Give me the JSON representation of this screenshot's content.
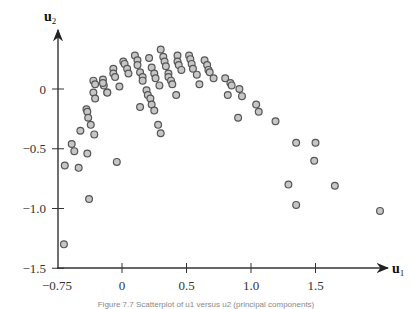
{
  "chart_data": {
    "type": "scatter",
    "title": "",
    "xlabel": "u",
    "xlabel_sub": "1",
    "ylabel": "u",
    "ylabel_sub": "2",
    "xlim": [
      -0.75,
      2.0
    ],
    "ylim": [
      -1.5,
      0.45
    ],
    "x_ticks": [
      {
        "value": -0.75,
        "label": "−0.75"
      },
      {
        "value": 0,
        "label": "0"
      },
      {
        "value": 0.5,
        "label": "0.5"
      },
      {
        "value": 1.0,
        "label": "1.0"
      },
      {
        "value": 1.5,
        "label": "1.5"
      }
    ],
    "y_ticks": [
      {
        "value": 0,
        "label": "0"
      },
      {
        "value": -0.5,
        "label": "−0.5"
      },
      {
        "value": -1.0,
        "label": "−1.0"
      },
      {
        "value": -1.5,
        "label": "−1.5"
      }
    ],
    "grid": false,
    "legend": null,
    "marker": {
      "fill": "#c6c6c6",
      "stroke": "#555555",
      "radius": 3.4
    },
    "points": [
      [
        -0.21,
        0.03
      ],
      [
        -0.17,
        -0.03
      ],
      [
        -0.33,
        -0.03
      ],
      [
        -0.31,
        -0.08
      ],
      [
        -0.41,
        -0.17
      ],
      [
        -0.4,
        -0.19
      ],
      [
        -0.39,
        -0.24
      ],
      [
        -0.36,
        -0.3
      ],
      [
        -0.48,
        -0.35
      ],
      [
        -0.32,
        -0.38
      ],
      [
        -0.58,
        -0.46
      ],
      [
        -0.55,
        -0.52
      ],
      [
        -0.4,
        -0.54
      ],
      [
        -0.66,
        -0.64
      ],
      [
        -0.5,
        -0.66
      ],
      [
        -0.06,
        -0.61
      ],
      [
        -0.38,
        -0.92
      ],
      [
        -0.67,
        -1.3
      ],
      [
        -0.33,
        0.07
      ],
      [
        -0.31,
        0.04
      ],
      [
        -0.22,
        0.08
      ],
      [
        -0.22,
        0.05
      ],
      [
        -0.17,
        -0.03
      ],
      [
        -0.1,
        0.17
      ],
      [
        -0.1,
        0.13
      ],
      [
        -0.08,
        0.1
      ],
      [
        -0.03,
        0.02
      ],
      [
        0.01,
        0.23
      ],
      [
        0.02,
        0.21
      ],
      [
        0.04,
        0.17
      ],
      [
        0.05,
        0.13
      ],
      [
        0.1,
        0.28
      ],
      [
        0.12,
        0.24
      ],
      [
        0.12,
        0.2
      ],
      [
        0.14,
        0.14
      ],
      [
        0.16,
        0.1
      ],
      [
        0.16,
        0.07
      ],
      [
        0.21,
        0.26
      ],
      [
        0.23,
        0.18
      ],
      [
        0.25,
        0.13
      ],
      [
        0.26,
        0.09
      ],
      [
        0.29,
        0.03
      ],
      [
        0.3,
        0.33
      ],
      [
        0.32,
        0.27
      ],
      [
        0.33,
        0.23
      ],
      [
        0.34,
        0.19
      ],
      [
        0.36,
        0.13
      ],
      [
        0.36,
        0.1
      ],
      [
        0.38,
        0.07
      ],
      [
        0.39,
        0.04
      ],
      [
        0.19,
        -0.01
      ],
      [
        0.2,
        -0.05
      ],
      [
        0.22,
        -0.08
      ],
      [
        0.23,
        -0.13
      ],
      [
        0.25,
        -0.18
      ],
      [
        0.28,
        -0.3
      ],
      [
        0.3,
        -0.37
      ],
      [
        0.14,
        -0.15
      ],
      [
        0.42,
        -0.05
      ],
      [
        0.43,
        0.28
      ],
      [
        0.43,
        0.23
      ],
      [
        0.44,
        0.2
      ],
      [
        0.46,
        0.16
      ],
      [
        0.52,
        0.28
      ],
      [
        0.53,
        0.25
      ],
      [
        0.54,
        0.21
      ],
      [
        0.55,
        0.17
      ],
      [
        0.58,
        0.12
      ],
      [
        0.6,
        0.04
      ],
      [
        0.64,
        0.24
      ],
      [
        0.66,
        0.2
      ],
      [
        0.67,
        0.16
      ],
      [
        0.68,
        0.14
      ],
      [
        0.71,
        0.09
      ],
      [
        0.8,
        0.09
      ],
      [
        0.84,
        0.05
      ],
      [
        0.85,
        0.03
      ],
      [
        0.82,
        -0.05
      ],
      [
        0.91,
        0.0
      ],
      [
        0.93,
        -0.06
      ],
      [
        0.9,
        -0.24
      ],
      [
        1.04,
        -0.13
      ],
      [
        1.06,
        -0.19
      ],
      [
        1.19,
        -0.27
      ],
      [
        1.35,
        -0.45
      ],
      [
        1.49,
        -0.6
      ],
      [
        1.65,
        -0.81
      ],
      [
        1.29,
        -0.8
      ],
      [
        1.35,
        -0.97
      ],
      [
        1.5,
        -0.45
      ],
      [
        2.0,
        -1.02
      ]
    ]
  },
  "caption": "Figure 7.7 Scatterplot of u1 versus u2 (principal components)"
}
